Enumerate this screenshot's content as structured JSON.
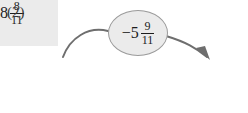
{
  "problem": {
    "label": "(2)"
  },
  "start_value": {
    "sign": "",
    "whole": "8",
    "numerator": "8",
    "denominator": "11",
    "full_text": "8 8/11"
  },
  "operation": {
    "sign": "−",
    "whole": "5",
    "numerator": "9",
    "denominator": "11",
    "full_text": "−5 9/11"
  },
  "answer": {
    "value": "",
    "placeholder": ""
  },
  "colors": {
    "box_fill": "#ebebeb",
    "box_border": "#9a9a9a",
    "answer_fill": "#ffffff",
    "bubble_fill": "#ebebeb",
    "arrow": "#6e6e6e",
    "text": "#1d1d1d",
    "label_text": "#3a3a3a"
  },
  "icons": {
    "left_connector": "curved-line",
    "right_connector": "curved-arrow-icon"
  }
}
